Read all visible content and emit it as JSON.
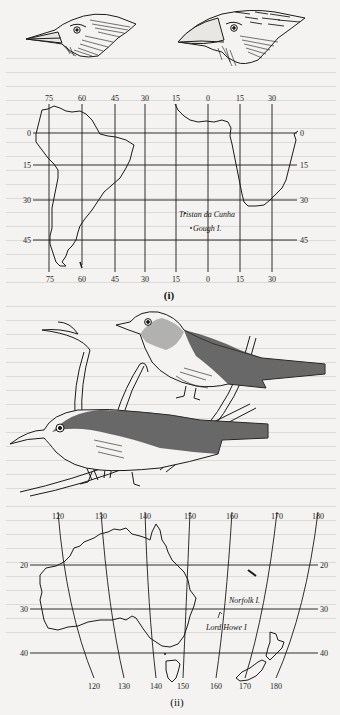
{
  "figure": {
    "panel_i": {
      "caption": "(i)",
      "top_bird_heads": [
        "finch-head-small-beak",
        "finch-head-large-beak"
      ],
      "map": {
        "region": "South America and southern Africa",
        "longitude_labels_top": [
          "75",
          "60",
          "45",
          "30",
          "15",
          "0",
          "15",
          "30"
        ],
        "longitude_labels_bottom": [
          "75",
          "60",
          "45",
          "30",
          "15",
          "0",
          "15",
          "30"
        ],
        "latitude_labels_left": [
          "0",
          "15",
          "30",
          "45"
        ],
        "latitude_labels_right": [
          "0",
          "15",
          "30",
          "45"
        ],
        "places": [
          {
            "name": "Tristan da Cunha"
          },
          {
            "name": "Gough I."
          }
        ]
      }
    },
    "panel_ii": {
      "caption": "(ii)",
      "birds": [
        "white-eye-upper",
        "white-eye-lower"
      ],
      "map": {
        "region": "Australia and New Zealand",
        "longitude_labels_top": [
          "120",
          "130",
          "140",
          "150",
          "160",
          "170",
          "180"
        ],
        "longitude_labels_bottom": [
          "120",
          "130",
          "140",
          "150",
          "160",
          "170",
          "180"
        ],
        "latitude_labels_left": [
          "20",
          "30",
          "40"
        ],
        "latitude_labels_right": [
          "20",
          "30",
          "40"
        ],
        "places": [
          {
            "name": "Norfolk I."
          },
          {
            "name": "Lord Howe I"
          }
        ]
      }
    }
  },
  "colors": {
    "paper": "#f4f3f1",
    "ink": "#1a1a1a"
  }
}
